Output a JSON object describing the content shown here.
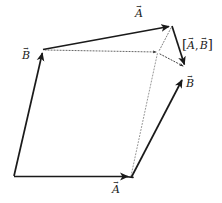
{
  "figure": {
    "kind": "vector-commutator-diagram",
    "background_color": "#ffffff",
    "stroke_color": "#1a1a1a",
    "dotted_color": "#555555",
    "width": 222,
    "height": 203,
    "labels": {
      "a_top": "A",
      "a_bottom": "A",
      "b_left": "B",
      "b_right": "B",
      "commutator_open": "[",
      "commutator_a": "A",
      "commutator_sep": ",",
      "commutator_b": "B",
      "commutator_close": "]"
    },
    "geometry": {
      "origin": [
        14,
        176
      ],
      "b_left_tip": [
        43,
        50
      ],
      "a_top_tip": [
        172,
        26
      ],
      "a_bottom_tip": [
        131,
        177
      ],
      "b_right_tip": [
        184,
        77
      ],
      "commutator_tip": [
        186,
        68
      ],
      "midpoint": [
        158,
        52
      ],
      "solid_edges": [
        {
          "name": "b-left-vector",
          "from": [
            14,
            176
          ],
          "to": [
            43,
            50
          ],
          "arrow": true
        },
        {
          "name": "a-top-vector",
          "from": [
            43,
            50
          ],
          "to": [
            172,
            26
          ],
          "arrow": true
        },
        {
          "name": "a-bottom-vector",
          "from": [
            14,
            176
          ],
          "to": [
            131,
            177
          ],
          "arrow": true
        },
        {
          "name": "b-right-vector",
          "from": [
            131,
            177
          ],
          "to": [
            184,
            77
          ],
          "arrow": true
        },
        {
          "name": "closing-edge",
          "from": [
            172,
            26
          ],
          "to": [
            186,
            68
          ],
          "arrow": true
        }
      ],
      "dotted_edges": [
        {
          "name": "dotted-a-horizontal",
          "from": [
            43,
            50
          ],
          "to": [
            158,
            52
          ],
          "arrow": true
        },
        {
          "name": "dotted-b-diagonal",
          "from": [
            131,
            177
          ],
          "to": [
            158,
            52
          ],
          "arrow": false
        },
        {
          "name": "dotted-gap-to-tip",
          "from": [
            158,
            52
          ],
          "to": [
            186,
            68
          ],
          "arrow": true
        },
        {
          "name": "dotted-top-right",
          "from": [
            172,
            26
          ],
          "to": [
            158,
            52
          ],
          "arrow": false
        }
      ]
    }
  }
}
